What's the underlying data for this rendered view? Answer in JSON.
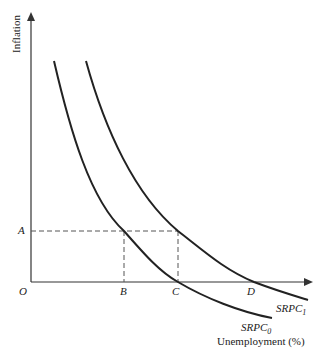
{
  "axes": {
    "y_label": "Inflation",
    "x_label": "Unemployment (%)",
    "origin_label": "O"
  },
  "points": {
    "A": "A",
    "B": "B",
    "C": "C",
    "D": "D"
  },
  "curves": {
    "srpc0": {
      "name": "SRPC",
      "subscript": "0"
    },
    "srpc1": {
      "name": "SRPC",
      "subscript": "1"
    }
  },
  "colors": {
    "line": "#222222",
    "dash": "#555555",
    "axis": "#333333"
  }
}
